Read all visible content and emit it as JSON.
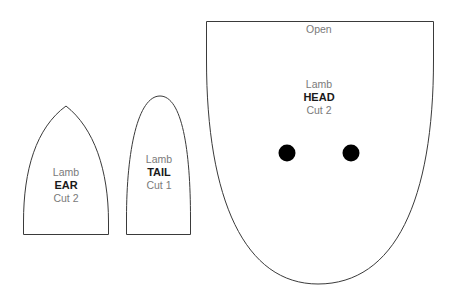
{
  "pieces": {
    "ear": {
      "line1": "Lamb",
      "name": "EAR",
      "cut": "Cut 2"
    },
    "tail": {
      "line1": "Lamb",
      "name": "TAIL",
      "cut": "Cut 1"
    },
    "head": {
      "opening_label": "Open",
      "line1": "Lamb",
      "name": "HEAD",
      "cut": "Cut 2",
      "eyes": 2
    }
  },
  "colors": {
    "outline": "#3a3a3a",
    "label_text": "#7a7a7a",
    "bold_text": "#1a1a1a",
    "eye_fill": "#000000",
    "background": "#ffffff"
  }
}
